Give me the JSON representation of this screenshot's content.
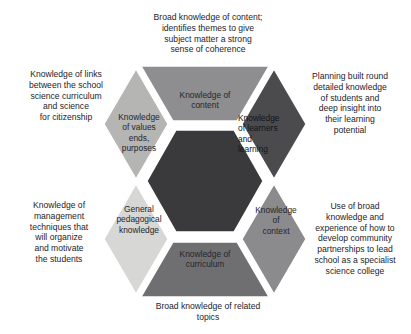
{
  "diagram": {
    "type": "hexagon-segment-diagram",
    "center": {
      "label": "",
      "color": "#3a3a3c"
    },
    "segments": [
      {
        "id": "content",
        "position": "top",
        "label": "Knowledge of\ncontent",
        "fill": "#8e8e90",
        "text_tone": "on-light"
      },
      {
        "id": "learners-and-learning",
        "position": "upper-right",
        "label": "Knowledge\nof learners\nand\n   learning",
        "fill": "#4b4b4e",
        "text_tone": "on-dark"
      },
      {
        "id": "context",
        "position": "lower-right",
        "label": "Knowledge\nof\ncontext",
        "fill": "#8b8b8e",
        "text_tone": "on-light"
      },
      {
        "id": "curriculum",
        "position": "bottom",
        "label": "Knowledge of\ncurriculum",
        "fill": "#6f6f72",
        "text_tone": "on-light"
      },
      {
        "id": "general-pedagogical-knowledge",
        "position": "lower-left",
        "label": "General\npedagogical\nknowledge",
        "fill": "#d7d7d6",
        "text_tone": "on-light"
      },
      {
        "id": "values-ends-purposes",
        "position": "upper-left",
        "label": "Knowledge\nof values\nends,\npurposes",
        "fill": "#b5b5b4",
        "text_tone": "on-light"
      }
    ],
    "annotations": [
      {
        "id": "top",
        "target": "content",
        "text": "Broad knowledge of content;\nidentifies themes to give\nsubject matter a strong\nsense of coherence"
      },
      {
        "id": "top-left",
        "target": "values-ends-purposes",
        "text": "Knowledge of links\nbetween the school\nscience curriculum\nand science\nfor citizenship"
      },
      {
        "id": "top-right",
        "target": "learners-and-learning",
        "text": "Planning built round\ndetailed knowledge\nof students and\ndeep insight into\ntheir learning\npotential"
      },
      {
        "id": "bottom-left",
        "target": "general-pedagogical-knowledge",
        "text": "Knowledge of\nmanagement\ntechniques that\nwill organize\nand motivate\nthe students"
      },
      {
        "id": "bottom-right",
        "target": "context",
        "text": "Use of broad\nknowledge and\nexperience of how to\ndevelop community\npartnerships to lead\nschool as a specialist\nscience college"
      },
      {
        "id": "bottom",
        "target": "curriculum",
        "text": "Broad knowledge of related\ntopics"
      }
    ],
    "colors": {
      "background": "#ffffff",
      "gap": "#ffffff",
      "outline": "#ffffff",
      "text": "#24242a"
    }
  }
}
